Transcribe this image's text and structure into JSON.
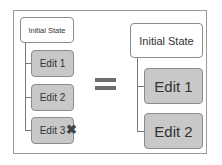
{
  "left_tree": {
    "root": "Initial State",
    "edits": [
      "Edit 1",
      "Edit 2",
      "Edit 3"
    ],
    "removed_marker": "✖"
  },
  "operator": "=",
  "right_tree": {
    "root": "Initial State",
    "edits": [
      "Edit 1",
      "Edit 2"
    ]
  }
}
